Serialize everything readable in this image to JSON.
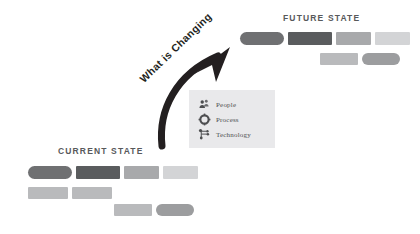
{
  "diagram": {
    "type": "current-to-future-state-transition",
    "arrow": {
      "label": "What is Changing",
      "color": "#231f20",
      "direction": "up-right"
    },
    "palette": {
      "dark": "#6f7072",
      "darkest": "#5a5c5e",
      "medium": "#a8a9ab",
      "light": "#d3d4d6",
      "title_text": "#58595b",
      "legend_bg": "#e9e9eb",
      "legend_text": "#4d4e50"
    },
    "current_state": {
      "title": "CURRENT STATE",
      "rows": [
        {
          "bars": [
            {
              "shape": "rounded",
              "color": "#6f7072",
              "x": 28,
              "y": 166,
              "w": 44,
              "h": 13
            },
            {
              "shape": "square",
              "color": "#5a5c5e",
              "x": 76,
              "y": 166,
              "w": 44,
              "h": 13
            },
            {
              "shape": "square",
              "color": "#a8a9ab",
              "x": 124,
              "y": 166,
              "w": 35,
              "h": 13
            },
            {
              "shape": "square",
              "color": "#d3d4d6",
              "x": 163,
              "y": 166,
              "w": 35,
              "h": 13
            }
          ]
        },
        {
          "bars": [
            {
              "shape": "square",
              "color": "#b9babc",
              "x": 28,
              "y": 187,
              "w": 40,
              "h": 12
            },
            {
              "shape": "square",
              "color": "#b9babc",
              "x": 72,
              "y": 187,
              "w": 40,
              "h": 12
            }
          ]
        },
        {
          "bars": [
            {
              "shape": "square",
              "color": "#b9babc",
              "x": 114,
              "y": 204,
              "w": 38,
              "h": 12
            },
            {
              "shape": "rounded",
              "color": "#9c9d9f",
              "x": 156,
              "y": 204,
              "w": 38,
              "h": 12
            }
          ]
        }
      ]
    },
    "future_state": {
      "title": "FUTURE STATE",
      "rows": [
        {
          "bars": [
            {
              "shape": "rounded",
              "color": "#6f7072",
              "x": 240,
              "y": 32,
              "w": 44,
              "h": 13
            },
            {
              "shape": "square",
              "color": "#5a5c5e",
              "x": 288,
              "y": 32,
              "w": 44,
              "h": 13
            },
            {
              "shape": "square",
              "color": "#a8a9ab",
              "x": 336,
              "y": 32,
              "w": 35,
              "h": 13
            },
            {
              "shape": "square",
              "color": "#d3d4d6",
              "x": 375,
              "y": 32,
              "w": 35,
              "h": 13
            }
          ]
        },
        {
          "bars": [
            {
              "shape": "square",
              "color": "#b9babc",
              "x": 320,
              "y": 53,
              "w": 38,
              "h": 12
            },
            {
              "shape": "rounded",
              "color": "#9c9d9f",
              "x": 362,
              "y": 53,
              "w": 38,
              "h": 12
            }
          ]
        }
      ]
    },
    "legend": {
      "items": [
        {
          "icon": "people-icon",
          "label": "People"
        },
        {
          "icon": "process-icon",
          "label": "Process"
        },
        {
          "icon": "technology-icon",
          "label": "Technology"
        }
      ]
    }
  }
}
